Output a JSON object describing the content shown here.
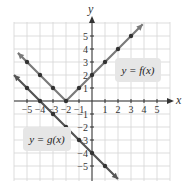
{
  "chart_data": {
    "type": "line",
    "title": "",
    "xlabel": "x",
    "ylabel": "y",
    "xlim": [
      -6,
      6
    ],
    "ylim": [
      -6,
      6
    ],
    "grid": true,
    "x_ticks": [
      -5,
      -4,
      -3,
      -2,
      -1,
      1,
      2,
      3,
      4,
      5
    ],
    "y_ticks": [
      -5,
      -4,
      -3,
      -2,
      -1,
      1,
      2,
      3,
      4,
      5
    ],
    "x_tick_labels": [
      "−5",
      "−4",
      "−3",
      "−2",
      "−1",
      "1",
      "2",
      "3",
      "4",
      "5"
    ],
    "y_tick_labels": [
      "−5",
      "−4",
      "−3",
      "−2",
      "−1",
      "1",
      "2",
      "3",
      "4",
      "5"
    ],
    "series": [
      {
        "name": "y = f(x)",
        "color": "#7a7a7a",
        "points": [
          [
            -5.7,
            3.7
          ],
          [
            -5,
            3
          ],
          [
            -4,
            2
          ],
          [
            -3,
            1
          ],
          [
            -2,
            0
          ],
          [
            -1,
            1
          ],
          [
            0,
            2
          ],
          [
            1,
            3
          ],
          [
            2,
            4
          ],
          [
            3,
            5
          ],
          [
            3.9,
            5.9
          ]
        ],
        "markers": [
          [
            -5,
            3
          ],
          [
            -4,
            2
          ],
          [
            -3,
            1
          ],
          [
            -2,
            0
          ],
          [
            -1,
            1
          ],
          [
            0,
            2
          ],
          [
            1,
            3
          ],
          [
            2,
            4
          ],
          [
            3,
            5
          ]
        ]
      },
      {
        "name": "y = g(x)",
        "color": "#555555",
        "points": [
          [
            -6,
            2
          ],
          [
            -5,
            1
          ],
          [
            -4,
            0
          ],
          [
            -3,
            -1
          ],
          [
            -2,
            -2
          ],
          [
            -1,
            -3
          ],
          [
            0,
            -4
          ],
          [
            1,
            -5
          ],
          [
            2,
            -6
          ]
        ],
        "markers": [
          [
            -5,
            1
          ],
          [
            -4,
            0
          ],
          [
            -3,
            -1
          ],
          [
            -2,
            -2
          ],
          [
            -1,
            -3
          ],
          [
            0,
            -4
          ],
          [
            1,
            -5
          ]
        ]
      }
    ],
    "annotations": [
      {
        "text": "y = f(x)",
        "x": 3.1,
        "y": 2.3
      },
      {
        "text": "y = g(x)",
        "x": -4.3,
        "y": -2.9
      }
    ]
  },
  "labels": {
    "x_axis": "x",
    "y_axis": "y",
    "f_label": "y = f(x)",
    "g_label": "y = g(x)"
  }
}
